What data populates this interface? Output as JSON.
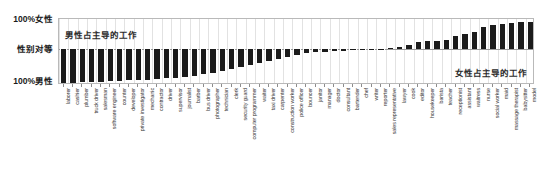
{
  "chart_data": {
    "type": "bar",
    "title": "",
    "subtitle": "",
    "xlabel": "",
    "ylabel": "",
    "ylim": [
      -100,
      100
    ],
    "grid": true,
    "legend_position": "none",
    "y_tick_labels": [
      "100%女性",
      "性别对等",
      "100%男性"
    ],
    "annotations": [
      {
        "text": "男性占主导的工作",
        "position": "top-left"
      },
      {
        "text": "女性占主导的工作",
        "position": "bottom-right"
      }
    ],
    "bar_color": "#1b1b1b",
    "categories": [
      "laborer",
      "cashier",
      "plumber",
      "truck driver",
      "salesman",
      "software engineer",
      "counter",
      "developer",
      "private investigator",
      "mechanic",
      "contractor",
      "driver",
      "supervisor",
      "journalist",
      "barber",
      "bus driver",
      "photographer",
      "technician",
      "clerk",
      "security guard",
      "computer programmer",
      "waiter",
      "taxi driver",
      "carpenter",
      "construction worker",
      "police officer",
      "bouncer",
      "janitor",
      "manager",
      "doctor",
      "consultant",
      "bartender",
      "chef",
      "writer",
      "reporter",
      "sales representative",
      "lawyer",
      "cook",
      "editor",
      "housekeeper",
      "barista",
      "teacher",
      "receptionist",
      "assistant",
      "waitress",
      "nurse",
      "social worker",
      "maid",
      "massage therapist",
      "babysitter",
      "model"
    ],
    "values": [
      -97,
      -96,
      -95,
      -94,
      -93,
      -92,
      -91,
      -90,
      -89,
      -88,
      -86,
      -84,
      -82,
      -79,
      -76,
      -72,
      -68,
      -64,
      -58,
      -52,
      -46,
      -40,
      -34,
      -28,
      -22,
      -17,
      -13,
      -10,
      -8,
      -6,
      -5,
      -4,
      -3,
      -2,
      -1,
      2,
      6,
      14,
      22,
      26,
      28,
      30,
      44,
      52,
      58,
      76,
      82,
      86,
      90,
      92,
      94
    ]
  }
}
